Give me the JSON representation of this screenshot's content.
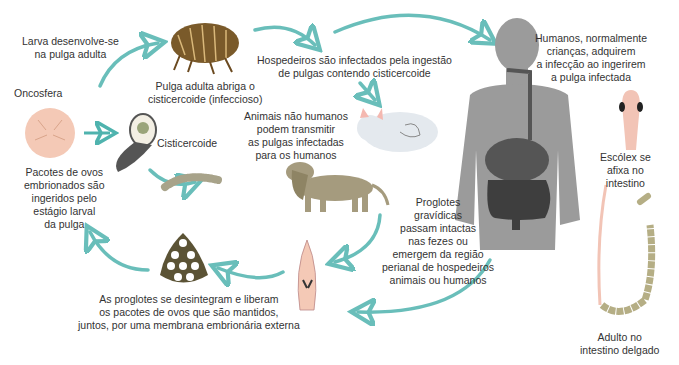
{
  "colors": {
    "arrow": "#4fb3ae",
    "flea": "#7a5a2a",
    "human_silhouette": "#9b9b9b",
    "oncosphere": "#f4c9b6",
    "dog": "#a59b7e",
    "cat": "#e4e9ee",
    "egg_packet": "#5b5335",
    "worm": "#b5ae85",
    "scolex": "#f2c4b6"
  },
  "labels": {
    "larva": [
      "Larva desenvolve-se",
      "na pulga adulta"
    ],
    "oncosfera": [
      "Oncosfera"
    ],
    "pulga": [
      "Pulga adulta abriga o",
      "cisticercoide (infeccioso)"
    ],
    "cisticercoide": [
      "Cisticercoide"
    ],
    "hospedeiros": [
      "Hospedeiros são infectados pela ingestão",
      "de pulgas contendo cisticercoide"
    ],
    "humanos": [
      "Humanos, normalmente",
      "crianças, adquirem",
      "a infecção ao ingerirem",
      "a pulga infectada"
    ],
    "animais": [
      "Animais não humanos",
      "podem transmitir",
      "as pulgas infectadas",
      "para os humanos"
    ],
    "pacotes": [
      "Pacotes de ovos",
      "embrionados são",
      "ingeridos pelo",
      "estágio larval",
      "da pulga"
    ],
    "escolex": [
      "Escólex se",
      "afixa no",
      "intestino"
    ],
    "proglotes": [
      "Proglotes",
      "gravídicas",
      "passam intactas",
      "nas fezes ou",
      "emergem da região",
      "perianal de hospedeiros",
      "animais ou humanos"
    ],
    "desintegram": [
      "As proglotes se desintegram e liberam",
      "os pacotes de ovos que são mantidos,",
      "juntos, por uma membrana embrionária externa"
    ],
    "adulto": [
      "Adulto no",
      "intestino delgado"
    ]
  }
}
